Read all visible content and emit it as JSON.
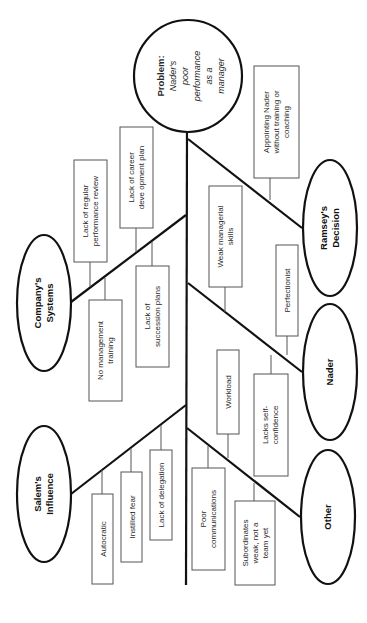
{
  "diagram": {
    "type": "fishbone",
    "orientation": "rotated-90-clockwise",
    "problem": {
      "label": "Problem:",
      "text_lines": [
        "Nader's",
        "poor",
        "performance",
        "as a",
        "manager"
      ]
    },
    "categories": [
      {
        "id": "ramsey",
        "label_lines": [
          "Ramsey's",
          "Decision"
        ],
        "causes": [
          {
            "lines": [
              "Appointing Nader",
              "without training or",
              "coaching"
            ]
          }
        ]
      },
      {
        "id": "nader",
        "label_lines": [
          "Nader"
        ],
        "causes": [
          {
            "lines": [
              "Weak managerial",
              "skills"
            ]
          },
          {
            "lines": [
              "Perfectionist"
            ]
          },
          {
            "lines": [
              "Lacks self-",
              "confidence"
            ]
          }
        ]
      },
      {
        "id": "other",
        "label_lines": [
          "Other"
        ],
        "causes": [
          {
            "lines": [
              "Workload"
            ]
          },
          {
            "lines": [
              "Poor",
              "communications"
            ]
          },
          {
            "lines": [
              "Subordinates",
              "weak, not a",
              "team yet"
            ]
          }
        ]
      },
      {
        "id": "company",
        "label_lines": [
          "Company's",
          "Systems"
        ],
        "causes": [
          {
            "lines": [
              "Lack of regular",
              "performance review"
            ]
          },
          {
            "lines": [
              "Lack of career",
              "deve opment plan"
            ]
          },
          {
            "lines": [
              "No management",
              "training"
            ]
          },
          {
            "lines": [
              "Lack of",
              "succession plans"
            ]
          }
        ]
      },
      {
        "id": "salem",
        "label_lines": [
          "Salem's",
          "Influence"
        ],
        "causes": [
          {
            "lines": [
              "Autocratic"
            ]
          },
          {
            "lines": [
              "Instilled fear"
            ]
          },
          {
            "lines": [
              "Lack of delegation"
            ]
          }
        ]
      }
    ]
  },
  "colors": {
    "background": "#ffffff",
    "bone": "#111111",
    "box_border": "#555555",
    "text": "#2a2a2a"
  }
}
